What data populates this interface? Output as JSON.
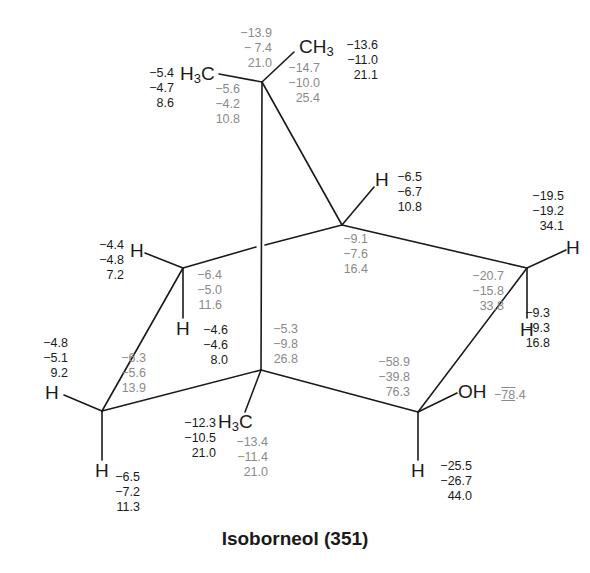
{
  "caption": "Isoborneol (351)",
  "colors": {
    "bond": "#1a1a1a",
    "proton_shift_text": "#1a1a1a",
    "carbon_shift_text": "#8a8a8a"
  },
  "atoms": {
    "ch3_top_right": {
      "main": "CH",
      "sub": "3"
    },
    "h3c_top_left": {
      "main": "H",
      "sub": "3",
      "tail": "C"
    },
    "h3c_bottom": {
      "main": "H",
      "sub": "3",
      "tail": "C"
    },
    "h_c4": "H",
    "h_c3_exo": "H",
    "h_c3_endo": "H",
    "h_c5_exo": "H",
    "h_c5_endo": "H",
    "h_c6_exo": "H",
    "h_c6_endo": "H",
    "h_c2": "H",
    "oh": "OH"
  },
  "shifts": {
    "c7_carbon": [
      "−13.9",
      "− 7.4",
      "21.0"
    ],
    "ch3_a_carbon": [
      "−14.7",
      "−10.0",
      "25.4"
    ],
    "ch3_a_proton": [
      "−13.6",
      "−11.0",
      "21.1"
    ],
    "ch3_b_proton": [
      "−5.4",
      "−4.7",
      "8.6"
    ],
    "ch3_b_carbon": [
      "−5.6",
      "−4.2",
      "10.8"
    ],
    "h4_proton": [
      "−6.5",
      "−6.7",
      "10.8"
    ],
    "c4_carbon": [
      "−9.1",
      "−7.6",
      "16.4"
    ],
    "h3_exo_proton": [
      "−19.5",
      "−19.2",
      "34.1"
    ],
    "c3_carbon": [
      "−20.7",
      "−15.8",
      "33.8"
    ],
    "h3_endo_proton": [
      "−9.3",
      "−9.3",
      "16.8"
    ],
    "h5_exo_proton": [
      "−4.4",
      "−4.8",
      "7.2"
    ],
    "c5_carbon": [
      "−6.4",
      "−5.0",
      "11.6"
    ],
    "h5_endo_proton": [
      "−4.6",
      "−4.6",
      "8.0"
    ],
    "c1_carbon": [
      "−5.3",
      "−9.8",
      "26.8"
    ],
    "h6_exo_proton": [
      "−4.8",
      "−5.1",
      "9.2"
    ],
    "c6_carbon": [
      "−6.3",
      "−5.6",
      "13.9"
    ],
    "c2_carbon": [
      "−58.9",
      "−39.8",
      "76.3"
    ],
    "oh_proton": {
      "prefix": "−",
      "underlined": "78",
      "suffix": ".4"
    },
    "ch3_c_proton": [
      "−12.3",
      "−10.5",
      "21.0"
    ],
    "ch3_c_carbon": [
      "−13.4",
      "−11.4",
      "21.0"
    ],
    "h6_endo_proton": [
      "−6.5",
      "−7.2",
      "11.3"
    ],
    "h2_proton": [
      "−25.5",
      "−26.7",
      "44.0"
    ]
  }
}
